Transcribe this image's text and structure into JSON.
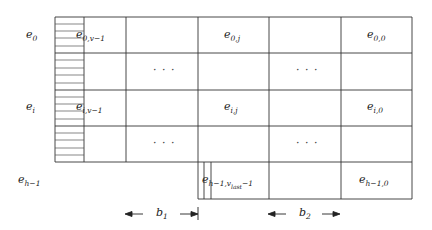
{
  "diagram": {
    "row_labels": [
      {
        "base": "e",
        "sub": "0"
      },
      {
        "base": "e",
        "sub": "i"
      },
      {
        "base": "e",
        "sub": "h−1"
      }
    ],
    "cells": {
      "r0_c0": {
        "base": "e",
        "sub": "0,v−1"
      },
      "r0_c2": {
        "base": "e",
        "sub": "0,j"
      },
      "r0_c4": {
        "base": "e",
        "sub": "0,0"
      },
      "r2_c0": {
        "base": "e",
        "sub": "i,v−1"
      },
      "r2_c2": {
        "base": "e",
        "sub": "i,j"
      },
      "r2_c4": {
        "base": "e",
        "sub": "i,0"
      },
      "r4_c2": {
        "base": "e",
        "sub": "h−1,v",
        "subsub": "last",
        "tail": "−1"
      },
      "r4_c4": {
        "base": "e",
        "sub": "h−1,0"
      }
    },
    "ellipsis": "· · ·",
    "dimensions": [
      {
        "base": "b",
        "sub": "1"
      },
      {
        "base": "b",
        "sub": "2"
      }
    ]
  }
}
